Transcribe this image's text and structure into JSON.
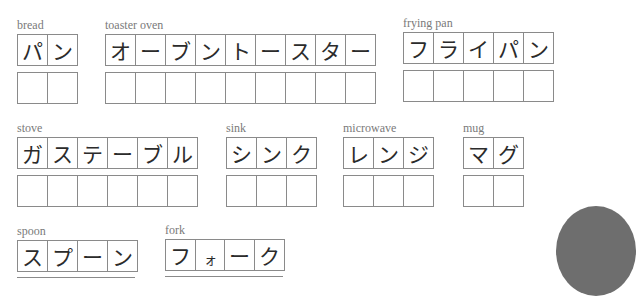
{
  "worksheet": {
    "words": [
      {
        "key": "bread",
        "label": "bread",
        "chars": [
          "パ",
          "ン"
        ]
      },
      {
        "key": "toaster_oven",
        "label": "toaster oven",
        "chars": [
          "オ",
          "ー",
          "ブ",
          "ン",
          "ト",
          "ー",
          "ス",
          "タ",
          "ー"
        ]
      },
      {
        "key": "frying_pan",
        "label": "frying pan",
        "chars": [
          "フ",
          "ラ",
          "イ",
          "パ",
          "ン"
        ]
      },
      {
        "key": "stove",
        "label": "stove",
        "chars": [
          "ガ",
          "ス",
          "テ",
          "ー",
          "ブ",
          "ル"
        ]
      },
      {
        "key": "sink",
        "label": "sink",
        "chars": [
          "シ",
          "ン",
          "ク"
        ]
      },
      {
        "key": "microwave",
        "label": "microwave",
        "chars": [
          "レ",
          "ン",
          "ジ"
        ]
      },
      {
        "key": "mug",
        "label": "mug",
        "chars": [
          "マ",
          "グ"
        ]
      },
      {
        "key": "spoon",
        "label": "spoon",
        "chars": [
          "ス",
          "プ",
          "ー",
          "ン"
        ]
      },
      {
        "key": "fork",
        "label": "fork",
        "chars": [
          "フ",
          "ォ",
          "ー",
          "ク"
        ]
      }
    ]
  },
  "colors": {
    "label": "#7a7a7a",
    "grid_line": "#8a8a8a",
    "glyph": "#2b2b2b",
    "circle": "#6e6e6e"
  }
}
